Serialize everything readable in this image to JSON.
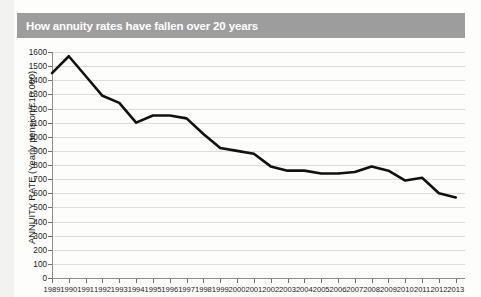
{
  "banner": {
    "title": "How annuity rates have fallen over 20 years",
    "background_color": "#9d9d9d",
    "text_color": "#ffffff"
  },
  "chart_data": {
    "type": "line",
    "title": "How annuity rates have fallen over 20 years",
    "xlabel": "",
    "ylabel": "ANNUITY RATE (Yearly pension/£10,000)",
    "series_color": "#111111",
    "grid": true,
    "grid_color": "#dcdcdc",
    "legend": "none",
    "xlim": [
      1989,
      2013
    ],
    "ylim": [
      0,
      1600
    ],
    "ytick_step": 100,
    "yticks": [
      0,
      100,
      200,
      300,
      400,
      500,
      600,
      700,
      800,
      900,
      1000,
      1100,
      1200,
      1300,
      1400,
      1500,
      1600
    ],
    "categories": [
      "1989",
      "1990",
      "1991",
      "1992",
      "1993",
      "1994",
      "1995",
      "1996",
      "1997",
      "1998",
      "1999",
      "2000",
      "2001",
      "2002",
      "2003",
      "2004",
      "2005",
      "2006",
      "2007",
      "2008",
      "2009",
      "2010",
      "2011",
      "2012",
      "2013"
    ],
    "values": [
      1450,
      1570,
      1430,
      1290,
      1240,
      1100,
      1150,
      1150,
      1130,
      1020,
      920,
      900,
      880,
      790,
      760,
      760,
      740,
      740,
      750,
      790,
      760,
      690,
      710,
      600,
      570
    ],
    "x": [
      1989,
      1990,
      1991,
      1992,
      1993,
      1994,
      1995,
      1996,
      1997,
      1998,
      1999,
      2000,
      2001,
      2002,
      2003,
      2004,
      2005,
      2006,
      2007,
      2008,
      2009,
      2010,
      2011,
      2012,
      2013
    ]
  }
}
